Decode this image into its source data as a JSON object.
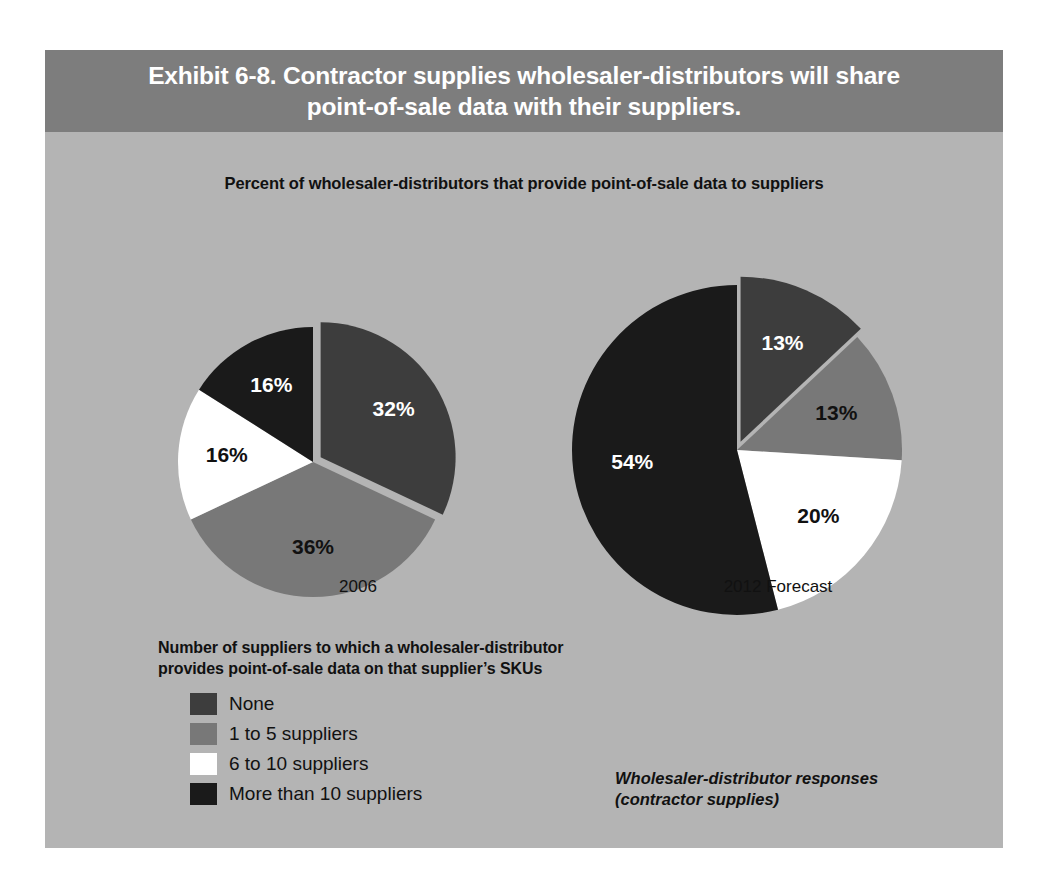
{
  "header": {
    "title": "Exhibit 6-8. Contractor supplies wholesaler-distributors will share\npoint-of-sale data with their suppliers."
  },
  "chart_subtitle": "Percent of wholesaler-distributors that provide point-of-sale data to suppliers",
  "legend": {
    "heading": "Number of suppliers to which a wholesaler-distributor\nprovides point-of-sale data on that supplier’s SKUs",
    "items": [
      {
        "label": "None",
        "color": "#3d3d3d"
      },
      {
        "label": "1 to 5 suppliers",
        "color": "#787878"
      },
      {
        "label": "6 to 10 suppliers",
        "color": "#ffffff"
      },
      {
        "label": "More than 10 suppliers",
        "color": "#1a1a1a"
      }
    ]
  },
  "source_note": "Wholesaler-distributor responses\n(contractor supplies)",
  "chart_data": {
    "type": "pie",
    "title": "Exhibit 6-8. Contractor supplies wholesaler-distributors will share point-of-sale data with their suppliers.",
    "subtitle": "Percent of wholesaler-distributors that provide point-of-sale data to suppliers",
    "categories": [
      "None",
      "1 to 5 suppliers",
      "6 to 10 suppliers",
      "More than 10 suppliers"
    ],
    "colors": [
      "#3d3d3d",
      "#787878",
      "#ffffff",
      "#1a1a1a"
    ],
    "legend_position": "bottom-left",
    "charts": [
      {
        "name": "2006",
        "caption": "2006",
        "center": [
          268,
          232
        ],
        "radius": 135,
        "exploded_index": 0,
        "slices": [
          {
            "category": "None",
            "value": 32,
            "label": "32%",
            "color": "#3d3d3d",
            "label_fill": "on-dark"
          },
          {
            "category": "1 to 5 suppliers",
            "value": 36,
            "label": "36%",
            "color": "#787878",
            "label_fill": "on-light"
          },
          {
            "category": "6 to 10 suppliers",
            "value": 16,
            "label": "16%",
            "color": "#ffffff",
            "label_fill": "on-light"
          },
          {
            "category": "More than 10 suppliers",
            "value": 16,
            "label": "16%",
            "color": "#1a1a1a",
            "label_fill": "on-dark"
          }
        ]
      },
      {
        "name": "2012 Forecast",
        "caption": "2012 Forecast",
        "center": [
          692,
          220
        ],
        "radius": 165,
        "exploded_index": 0,
        "slices": [
          {
            "category": "None",
            "value": 13,
            "label": "13%",
            "color": "#3d3d3d",
            "label_fill": "on-dark"
          },
          {
            "category": "1 to 5 suppliers",
            "value": 13,
            "label": "13%",
            "color": "#787878",
            "label_fill": "on-light"
          },
          {
            "category": "6 to 10 suppliers",
            "value": 20,
            "label": "20%",
            "color": "#ffffff",
            "label_fill": "on-light"
          },
          {
            "category": "More than 10 suppliers",
            "value": 54,
            "label": "54%",
            "color": "#1a1a1a",
            "label_fill": "on-dark"
          }
        ]
      }
    ]
  }
}
